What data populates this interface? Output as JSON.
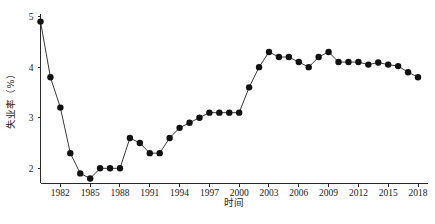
{
  "chart_data": {
    "type": "line",
    "title": "",
    "xlabel": "时间",
    "ylabel": "失业率（%）",
    "xlim": [
      1980,
      2018
    ],
    "ylim": [
      1.7,
      5.05
    ],
    "grid": false,
    "legend": null,
    "xticks": [
      1982,
      1985,
      1988,
      1991,
      1994,
      1997,
      2000,
      2003,
      2006,
      2009,
      2012,
      2015,
      2018
    ],
    "xticklabels": [
      "1982",
      "1985",
      "1988",
      "1991",
      "1994",
      "1997",
      "2000",
      "2003",
      "2006",
      "2009",
      "2012",
      "2015",
      "2018"
    ],
    "yticks": [
      2,
      3,
      4,
      5
    ],
    "yticklabels": [
      "2",
      "3",
      "4",
      "5"
    ],
    "marker": "filled-circle",
    "marker_color": "#111111",
    "line_color": "#3a3a3a",
    "series": [
      {
        "name": "失业率",
        "x": [
          1980,
          1981,
          1982,
          1983,
          1984,
          1985,
          1986,
          1987,
          1988,
          1989,
          1990,
          1991,
          1992,
          1993,
          1994,
          1995,
          1996,
          1997,
          1998,
          1999,
          2000,
          2001,
          2002,
          2003,
          2004,
          2005,
          2006,
          2007,
          2008,
          2009,
          2010,
          2011,
          2012,
          2013,
          2014,
          2015,
          2016,
          2017,
          2018
        ],
        "y": [
          4.9,
          3.8,
          3.2,
          2.3,
          1.9,
          1.8,
          2.0,
          2.0,
          2.0,
          2.6,
          2.5,
          2.3,
          2.3,
          2.6,
          2.8,
          2.9,
          3.0,
          3.1,
          3.1,
          3.1,
          3.1,
          3.6,
          4.0,
          4.3,
          4.2,
          4.2,
          4.1,
          4.0,
          4.2,
          4.3,
          4.1,
          4.1,
          4.1,
          4.05,
          4.09,
          4.05,
          4.02,
          3.9,
          3.8
        ]
      }
    ]
  },
  "figure": {
    "caption": "",
    "axis": {
      "x_title": "时间",
      "y_title": "失业率（%）"
    }
  }
}
